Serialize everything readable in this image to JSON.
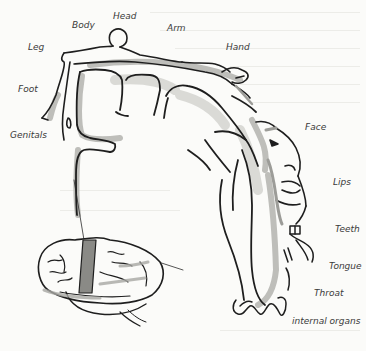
{
  "figure": {
    "labels": [
      {
        "id": "leg",
        "text": "Leg",
        "x": 28,
        "y": 43
      },
      {
        "id": "body",
        "text": "Body",
        "x": 72,
        "y": 21
      },
      {
        "id": "head",
        "text": "Head",
        "x": 113,
        "y": 12
      },
      {
        "id": "arm",
        "text": "Arm",
        "x": 167,
        "y": 24
      },
      {
        "id": "hand",
        "text": "Hand",
        "x": 226,
        "y": 43
      },
      {
        "id": "foot",
        "text": "Foot",
        "x": 18,
        "y": 85
      },
      {
        "id": "genitals",
        "text": "Genitals",
        "x": 10,
        "y": 131
      },
      {
        "id": "face",
        "text": "Face",
        "x": 305,
        "y": 123
      },
      {
        "id": "lips",
        "text": "Lips",
        "x": 333,
        "y": 178
      },
      {
        "id": "teeth",
        "text": "Teeth",
        "x": 335,
        "y": 225
      },
      {
        "id": "tongue",
        "text": "Tongue",
        "x": 329,
        "y": 262
      },
      {
        "id": "throat",
        "text": "Throat",
        "x": 314,
        "y": 289
      },
      {
        "id": "internal_organs",
        "text": "internal organs",
        "x": 292,
        "y": 317
      }
    ],
    "colors": {
      "ink": "#1e1e1e",
      "shade": "#a8a8a4",
      "shade_light": "#cfcfcb",
      "background": "#fbfbf9",
      "label": "#3a3a3a"
    }
  }
}
